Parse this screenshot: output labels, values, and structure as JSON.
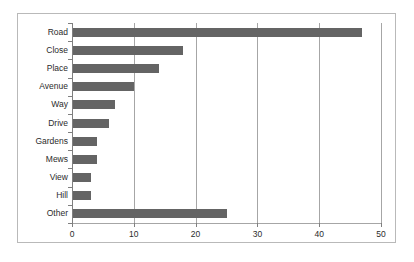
{
  "chart_data": {
    "type": "bar",
    "orientation": "horizontal",
    "title": "",
    "subtitle": "",
    "xlabel": "",
    "ylabel": "",
    "categories": [
      "Road",
      "Close",
      "Place",
      "Avenue",
      "Way",
      "Drive",
      "Gardens",
      "Mews",
      "View",
      "Hill",
      "Other"
    ],
    "values": [
      47,
      18,
      14,
      10,
      7,
      6,
      4,
      4,
      3,
      3,
      25
    ],
    "xticks": [
      "0",
      "10",
      "20",
      "30",
      "40",
      "50"
    ],
    "xtick_values": [
      0,
      10,
      20,
      30,
      40,
      50
    ],
    "xlim": [
      0,
      50
    ],
    "grid": "vertical",
    "legend": "none",
    "bar_color": "#646464",
    "gridline_color": "#a6a6a6",
    "axis_color": "#7f7f7f",
    "frame_color": "#b9b9b9",
    "background_color": "#ffffff",
    "text_color": "#2b2b2b"
  }
}
